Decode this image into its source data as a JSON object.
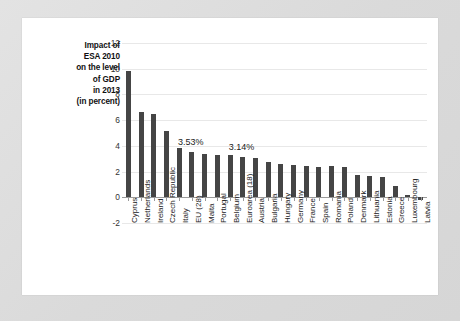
{
  "chart_data": {
    "type": "bar",
    "title": "Impact of ESA 2010 on the level of GDP in 2013 (in percent)",
    "title_lines": [
      "Impact of",
      "ESA 2010",
      "on the level",
      "of GDP",
      "in 2013",
      "(in percent)"
    ],
    "xlabel": "",
    "ylabel": "",
    "ylim": [
      -2,
      12
    ],
    "yticks": [
      -2,
      0,
      2,
      4,
      6,
      8,
      10,
      12
    ],
    "ytick_labels": [
      "-2",
      "0",
      "2",
      "4",
      "6",
      "8",
      "10",
      "12"
    ],
    "grid": true,
    "legend": "none",
    "bar_color": "#454545",
    "categories": [
      "Cyprus",
      "Netherlands",
      "Ireland",
      "Czech Republic",
      "Italy",
      "EU (28)",
      "Malta",
      "Portugal",
      "Belgium",
      "Euroarea (18)",
      "Austria",
      "Bulgaria",
      "Hungary",
      "Germany",
      "France",
      "Spain",
      "Romania",
      "Poland",
      "Denmark",
      "Lithuania",
      "Estonia",
      "Greece",
      "Luxembourg",
      "Latvia"
    ],
    "values": [
      9.8,
      6.6,
      6.5,
      5.15,
      3.8,
      3.53,
      3.35,
      3.3,
      3.3,
      3.14,
      3.05,
      2.75,
      2.6,
      2.55,
      2.4,
      2.35,
      2.4,
      2.35,
      1.75,
      1.65,
      1.6,
      0.9,
      0.15,
      -0.25
    ],
    "annotations": [
      {
        "label": "3.53%",
        "category": "EU (28)",
        "value": 3.53
      },
      {
        "label": "3.14%",
        "category": "Euroarea (18)",
        "value": 3.14
      }
    ]
  }
}
